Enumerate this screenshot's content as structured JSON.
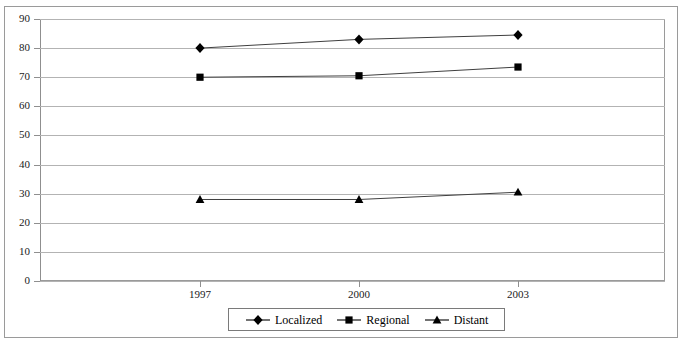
{
  "chart_data": {
    "type": "line",
    "title": "",
    "xlabel": "",
    "ylabel": "",
    "categories": [
      "1997",
      "2000",
      "2003"
    ],
    "ylim": [
      0,
      90
    ],
    "yticks": [
      "0",
      "10",
      "20",
      "30",
      "40",
      "50",
      "60",
      "70",
      "80",
      "90"
    ],
    "grid": true,
    "legend_position": "bottom",
    "series": [
      {
        "name": "Localized",
        "marker": "diamond",
        "color": "#000000",
        "values": [
          80,
          83,
          84.5
        ]
      },
      {
        "name": "Regional",
        "marker": "square",
        "color": "#000000",
        "values": [
          70,
          70.5,
          73.5
        ]
      },
      {
        "name": "Distant",
        "marker": "triangle",
        "color": "#000000",
        "values": [
          28,
          28,
          30.5
        ]
      }
    ]
  },
  "legend": {
    "items": [
      {
        "label": "Localized",
        "marker": "diamond-marker-icon"
      },
      {
        "label": "Regional",
        "marker": "square-marker-icon"
      },
      {
        "label": "Distant",
        "marker": "triangle-marker-icon"
      }
    ]
  },
  "colors": {
    "line": "#3f3f3f",
    "marker": "#000000",
    "grid": "#b3b3b3",
    "axis": "#8f8f8f",
    "border": "#9a9a9a",
    "background": "#ffffff"
  }
}
